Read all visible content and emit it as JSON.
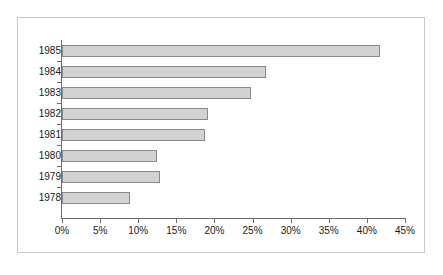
{
  "chart_data": {
    "type": "bar",
    "orientation": "horizontal",
    "title": "",
    "xlabel": "",
    "ylabel": "",
    "categories": [
      "1985",
      "1984",
      "1983",
      "1982",
      "1981",
      "1980",
      "1979",
      "1978"
    ],
    "values": [
      41.7,
      26.8,
      24.8,
      19.1,
      18.8,
      12.4,
      12.9,
      8.9
    ],
    "xtick_labels": [
      "0%",
      "5%",
      "10%",
      "15%",
      "20%",
      "25%",
      "30%",
      "35%",
      "40%",
      "45%"
    ],
    "xtick_values": [
      0,
      5,
      10,
      15,
      20,
      25,
      30,
      35,
      40,
      45
    ],
    "xlim": [
      0,
      45
    ],
    "grid": false,
    "legend": null,
    "colors": {
      "bar_fill": "#d2d2d2",
      "bar_edge": "#8a8a8a",
      "axis": "#6e6e6e",
      "text": "#1a1a1a",
      "frame": "#c8c8c8",
      "background": "#ffffff"
    }
  }
}
